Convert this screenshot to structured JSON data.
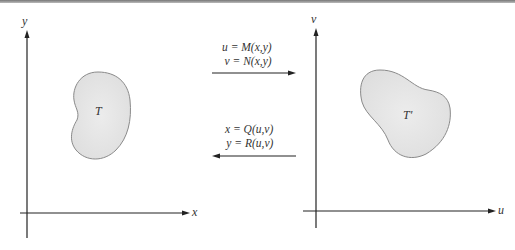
{
  "left_plane": {
    "x_axis_label": "x",
    "y_axis_label": "y",
    "region_label": "T"
  },
  "right_plane": {
    "x_axis_label": "u",
    "y_axis_label": "v",
    "region_label": "T′"
  },
  "forward_map": {
    "line1": "u = M(x,y)",
    "line2": "v = N(x,y)",
    "direction": "right"
  },
  "inverse_map": {
    "line1": "x = Q(u,v)",
    "line2": "y = R(u,v)",
    "direction": "left"
  },
  "colors": {
    "region_fill": "#e6e6e6",
    "region_stroke": "#8a8a8a",
    "axis": "#222222"
  }
}
